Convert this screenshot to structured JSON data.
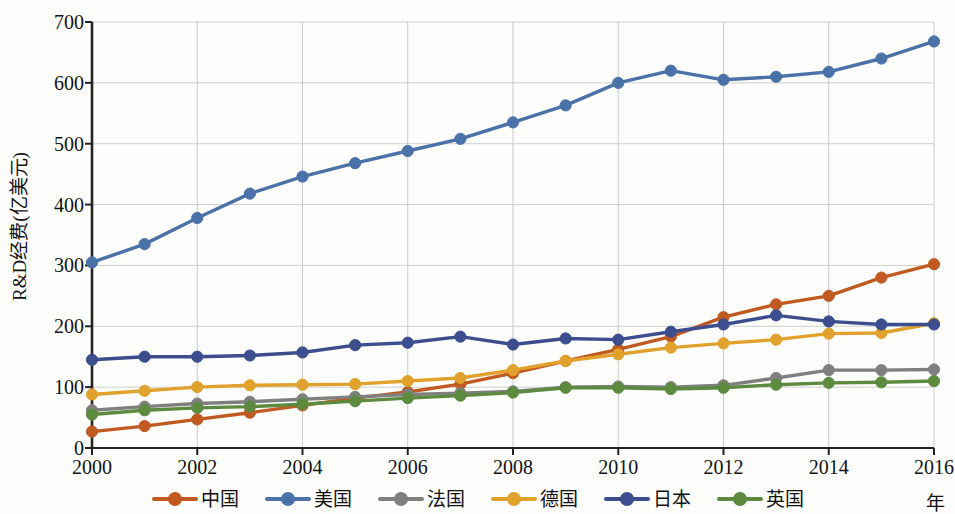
{
  "chart_data": {
    "type": "line",
    "title": "",
    "subtitle": "",
    "xlabel": "年",
    "ylabel": "R&D经费(亿美元)",
    "x": [
      2000,
      2001,
      2002,
      2003,
      2004,
      2005,
      2006,
      2007,
      2008,
      2009,
      2010,
      2011,
      2012,
      2013,
      2014,
      2015,
      2016
    ],
    "xtick_labels": [
      "2000",
      "2002",
      "2004",
      "2006",
      "2008",
      "2010",
      "2012",
      "2014",
      "2016"
    ],
    "xtick_values": [
      2000,
      2002,
      2004,
      2006,
      2008,
      2010,
      2012,
      2014,
      2016
    ],
    "ytick_labels": [
      "0",
      "100",
      "200",
      "300",
      "400",
      "500",
      "600",
      "700"
    ],
    "ytick_values": [
      0,
      100,
      200,
      300,
      400,
      500,
      600,
      700
    ],
    "xlim": [
      2000,
      2016
    ],
    "ylim": [
      0,
      700
    ],
    "grid": true,
    "legend_position": "bottom",
    "markers": "circle",
    "series": [
      {
        "name": "中国",
        "color": "#C15A21",
        "values": [
          27,
          36,
          47,
          58,
          70,
          82,
          92,
          105,
          123,
          143,
          162,
          183,
          215,
          236,
          250,
          280,
          302
        ]
      },
      {
        "name": "美国",
        "color": "#4A72A8",
        "values": [
          305,
          335,
          378,
          418,
          446,
          468,
          488,
          508,
          535,
          563,
          600,
          620,
          605,
          610,
          618,
          640,
          668
        ]
      },
      {
        "name": "法国",
        "color": "#7F7F7F",
        "values": [
          62,
          68,
          73,
          76,
          80,
          84,
          88,
          90,
          93,
          100,
          101,
          100,
          103,
          115,
          128,
          128,
          129
        ]
      },
      {
        "name": "德国",
        "color": "#E0A22C",
        "values": [
          88,
          94,
          100,
          103,
          104,
          105,
          110,
          115,
          128,
          143,
          154,
          165,
          172,
          178,
          188,
          189,
          205
        ]
      },
      {
        "name": "日本",
        "color": "#3C4E8D",
        "values": [
          145,
          150,
          150,
          152,
          157,
          169,
          173,
          183,
          170,
          180,
          178,
          191,
          203,
          218,
          208,
          203,
          203
        ]
      },
      {
        "name": "英国",
        "color": "#5C8B3F",
        "values": [
          55,
          62,
          66,
          68,
          72,
          77,
          82,
          86,
          91,
          99,
          99,
          97,
          99,
          104,
          107,
          108,
          110
        ]
      }
    ]
  },
  "legend": {
    "items": [
      {
        "label": "中国",
        "color": "#C15A21"
      },
      {
        "label": "美国",
        "color": "#4A72A8"
      },
      {
        "label": "法国",
        "color": "#7F7F7F"
      },
      {
        "label": "德国",
        "color": "#E0A22C"
      },
      {
        "label": "日本",
        "color": "#3C4E8D"
      },
      {
        "label": "英国",
        "color": "#5C8B3F"
      }
    ]
  },
  "axes": {
    "y_title": "R&D经费(亿美元)",
    "x_title": "年"
  }
}
